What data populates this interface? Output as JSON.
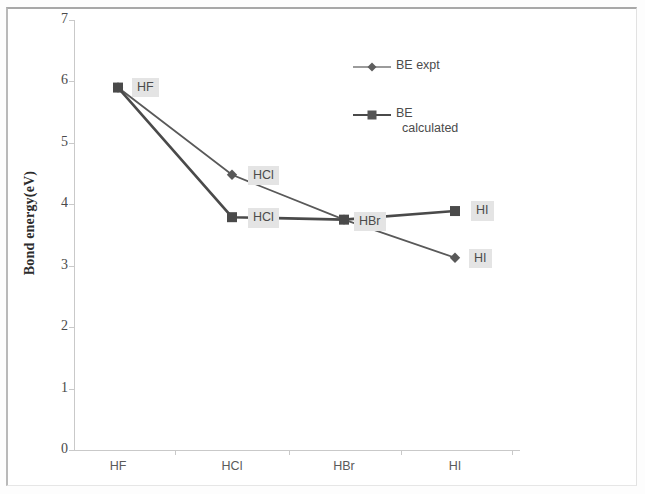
{
  "chart_data": {
    "type": "line",
    "title": "",
    "xlabel": "",
    "ylabel": "Bond energy(eV)",
    "categories": [
      "HF",
      "HCl",
      "HBr",
      "HI"
    ],
    "ylim": [
      0,
      7
    ],
    "y_ticks": [
      "0",
      "1",
      "2",
      "3",
      "4",
      "5",
      "6",
      "7"
    ],
    "grid": false,
    "legend_position": "upper-center-right",
    "series": [
      {
        "name": "BE expt",
        "marker": "diamond",
        "color": "#595959",
        "values": [
          5.9,
          4.48,
          3.75,
          3.13
        ],
        "point_labels": [
          "HF",
          "HCl",
          "HBr",
          "HI"
        ]
      },
      {
        "name": "BE calculated",
        "marker": "square",
        "color": "#4a4a4a",
        "values": [
          5.9,
          3.79,
          3.75,
          3.89
        ],
        "point_labels": [
          "HF",
          "HCl",
          "HBr",
          "HI"
        ]
      }
    ]
  },
  "axis": {
    "y_title": "Bond energy(eV)",
    "y_ticks": [
      "7",
      "6",
      "5",
      "4",
      "3",
      "2",
      "1",
      "0"
    ],
    "x_ticks": [
      "HF",
      "HCl",
      "HBr",
      "HI"
    ]
  },
  "legend": {
    "entries": [
      {
        "label": "BE expt",
        "label_line1": "BE expt",
        "label_line2": "",
        "marker": "diamond-marker",
        "color": "#6e6e6e"
      },
      {
        "label": "BE calculated",
        "label_line1": "BE",
        "label_line2": "calculated",
        "marker": "square-marker",
        "color": "#4a4a4a"
      }
    ]
  },
  "data_labels": {
    "expt": [
      "HF",
      "HCl",
      "HBr",
      "HI"
    ],
    "calculated": [
      "HF",
      "HCl",
      "HBr",
      "HI"
    ]
  }
}
